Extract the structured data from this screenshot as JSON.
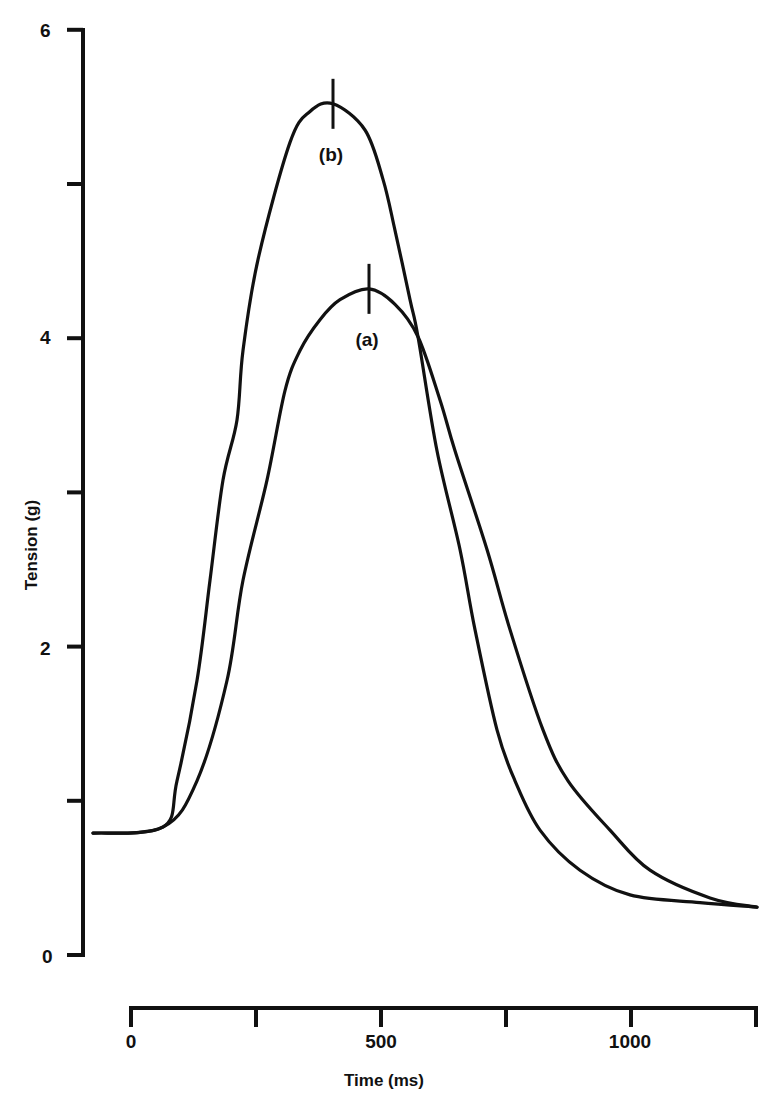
{
  "chart_data": {
    "type": "line",
    "title": "",
    "xlabel": "Time (ms)",
    "ylabel": "Tension (g)",
    "xlim": [
      -76,
      1250
    ],
    "ylim": [
      0,
      6
    ],
    "grid": false,
    "legend": "none (inline labels at peaks)",
    "x_ticks": [
      0,
      250,
      500,
      750,
      1000,
      1250
    ],
    "x_tick_labels": [
      "0",
      "",
      "500",
      "",
      "1000",
      ""
    ],
    "y_ticks": [
      0,
      1,
      2,
      3,
      4,
      5,
      6
    ],
    "y_tick_labels": [
      "0",
      "",
      "2",
      "",
      "4",
      "",
      "6"
    ],
    "series": [
      {
        "name": "(a)",
        "label": "(a)",
        "peak": {
          "x": 476,
          "y": 4.32
        },
        "x": [
          -76,
          64,
          132,
          192,
          224,
          272,
          308,
          338,
          378,
          418,
          476,
          528,
          574,
          618,
          648,
          712,
          758,
          824,
          874,
          958,
          1038,
          1158,
          1252
        ],
        "y": [
          0.79,
          0.83,
          1.13,
          1.78,
          2.43,
          3.08,
          3.66,
          3.92,
          4.12,
          4.25,
          4.32,
          4.22,
          4.01,
          3.6,
          3.27,
          2.63,
          2.11,
          1.46,
          1.13,
          0.81,
          0.55,
          0.37,
          0.31
        ]
      },
      {
        "name": "(b)",
        "label": "(b)",
        "peak": {
          "x": 404,
          "y": 5.52
        },
        "x": [
          -76,
          64,
          92,
          132,
          158,
          184,
          212,
          224,
          254,
          318,
          358,
          404,
          468,
          504,
          528,
          558,
          574,
          612,
          658,
          688,
          732,
          768,
          818,
          898,
          998,
          1138,
          1252
        ],
        "y": [
          0.79,
          0.83,
          1.13,
          1.78,
          2.43,
          3.08,
          3.47,
          3.92,
          4.51,
          5.27,
          5.47,
          5.52,
          5.35,
          5.03,
          4.7,
          4.25,
          4.01,
          3.27,
          2.63,
          2.11,
          1.46,
          1.13,
          0.81,
          0.55,
          0.39,
          0.34,
          0.31
        ]
      }
    ]
  },
  "labels": {
    "xlabel": "Time (ms)",
    "ylabel": "Tension (g)",
    "curve_a": "(a)",
    "curve_b": "(b)",
    "y_tick_0": "0",
    "y_tick_2": "2",
    "y_tick_4": "4",
    "y_tick_6": "6",
    "x_tick_0": "0",
    "x_tick_500": "500",
    "x_tick_1000": "1000"
  }
}
